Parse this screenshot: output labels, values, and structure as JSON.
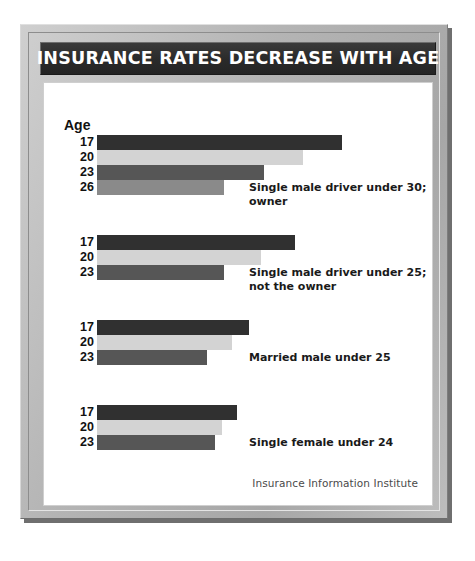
{
  "poster": {
    "title": "INSURANCE RATES DECREASE WITH AGE",
    "credit": "Insurance Information Institute",
    "axis_title": "Age",
    "frame_color": "#b6b6b6",
    "title_bar_color": "#2b2b2b",
    "panel_color": "#ffffff"
  },
  "chart_data": {
    "type": "bar",
    "orientation": "horizontal",
    "title": "INSURANCE RATES DECREASE WITH AGE",
    "xlabel": "",
    "ylabel": "Age",
    "grid": false,
    "legend": "none",
    "source": "Insurance Information Institute",
    "note": "Bar lengths represent relative insurance rates; axis is unlabeled.",
    "xlim": [
      0,
      100
    ],
    "groups": [
      {
        "caption": "Single male driver under 30; owner",
        "categories": [
          "17",
          "20",
          "23",
          "26"
        ],
        "values": [
          100,
          84,
          68,
          52
        ],
        "colors": [
          "#303030",
          "#d3d3d3",
          "#565656",
          "#8a8a8a"
        ]
      },
      {
        "caption": "Single male driver under 25; not the owner",
        "categories": [
          "17",
          "20",
          "23"
        ],
        "values": [
          81,
          67,
          52
        ],
        "colors": [
          "#303030",
          "#d3d3d3",
          "#565656"
        ]
      },
      {
        "caption": "Married male under 25",
        "categories": [
          "17",
          "20",
          "23"
        ],
        "values": [
          62,
          55,
          45
        ],
        "colors": [
          "#303030",
          "#d3d3d3",
          "#565656"
        ]
      },
      {
        "caption": "Single female under 24",
        "categories": [
          "17",
          "20",
          "23"
        ],
        "values": [
          57,
          51,
          48
        ],
        "colors": [
          "#303030",
          "#d3d3d3",
          "#565656"
        ]
      }
    ]
  },
  "groups_layout": [
    {
      "top": 52,
      "caption_top": 98,
      "caption_left": 205
    },
    {
      "top": 152,
      "caption_top": 183,
      "caption_left": 205
    },
    {
      "top": 237,
      "caption_top": 268,
      "caption_left": 205
    },
    {
      "top": 322,
      "caption_top": 353,
      "caption_left": 205
    }
  ]
}
